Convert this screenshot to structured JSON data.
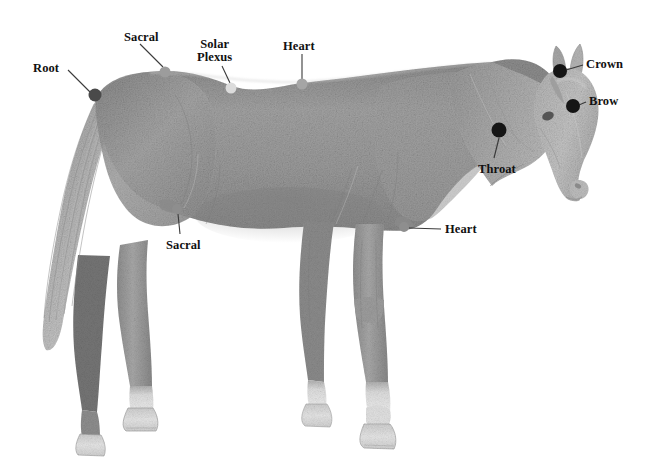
{
  "figure": {
    "style": "pencil drawing",
    "background_color": "#ffffff",
    "width": 655,
    "height": 471
  },
  "points": [
    {
      "id": "root",
      "label": "Root",
      "label_lines": [
        "Root"
      ],
      "label_x": 33,
      "label_y": 62,
      "dot_x": 95,
      "dot_y": 95,
      "dot_r": 6.5,
      "dot_color": "#4a4a4a",
      "leader_x1": 68,
      "leader_y1": 70,
      "leader_x2": 90,
      "leader_y2": 92
    },
    {
      "id": "sacral-upper",
      "label": "Sacral",
      "label_lines": [
        "Sacral"
      ],
      "label_x": 124,
      "label_y": 31,
      "dot_x": 165,
      "dot_y": 72,
      "dot_r": 5.5,
      "dot_color": "#9c9c9c",
      "leader_x1": 140,
      "leader_y1": 44,
      "leader_x2": 163,
      "leader_y2": 67
    },
    {
      "id": "solar-plexus",
      "label": "Solar Plexus",
      "label_lines": [
        "Solar",
        "Plexus"
      ],
      "label_x": 197,
      "label_y": 38,
      "dot_x": 231,
      "dot_y": 88,
      "dot_r": 5.5,
      "dot_color": "#dcdcdc",
      "leader_x1": 222,
      "leader_y1": 66,
      "leader_x2": 230,
      "leader_y2": 83
    },
    {
      "id": "heart-upper",
      "label": "Heart",
      "label_lines": [
        "Heart"
      ],
      "label_x": 283,
      "label_y": 40,
      "dot_x": 302,
      "dot_y": 84,
      "dot_r": 5.5,
      "dot_color": "#a5a5a5",
      "leader_x1": 302,
      "leader_y1": 54,
      "leader_x2": 302,
      "leader_y2": 79
    },
    {
      "id": "crown",
      "label": "Crown",
      "label_lines": [
        "Crown"
      ],
      "label_x": 586,
      "label_y": 58,
      "dot_x": 560,
      "dot_y": 71,
      "dot_r": 7,
      "dot_color": "#151515",
      "leader_x1": 583,
      "leader_y1": 65,
      "leader_x2": 566,
      "leader_y2": 70
    },
    {
      "id": "brow",
      "label": "Brow",
      "label_lines": [
        "Brow"
      ],
      "label_x": 589,
      "label_y": 95,
      "dot_x": 573,
      "dot_y": 106,
      "dot_r": 7,
      "dot_color": "#151515",
      "leader_x1": 586,
      "leader_y1": 102,
      "leader_x2": 579,
      "leader_y2": 105
    },
    {
      "id": "throat",
      "label": "Throat",
      "label_lines": [
        "Throat"
      ],
      "label_x": 478,
      "label_y": 163,
      "dot_x": 499,
      "dot_y": 130,
      "dot_r": 7.5,
      "dot_color": "#151515",
      "leader_x1": 494,
      "leader_y1": 158,
      "leader_x2": 499,
      "leader_y2": 138
    },
    {
      "id": "sacral-lower",
      "label": "Sacral",
      "label_lines": [
        "Sacral"
      ],
      "label_x": 166,
      "label_y": 239,
      "dot_x": 177,
      "dot_y": 209,
      "dot_r": 5,
      "dot_color": "#8e8e8e",
      "leader_x1": 180,
      "leader_y1": 234,
      "leader_x2": 178,
      "leader_y2": 214
    },
    {
      "id": "heart-lower",
      "label": "Heart",
      "label_lines": [
        "Heart"
      ],
      "label_x": 445,
      "label_y": 223,
      "dot_x": 404,
      "dot_y": 227,
      "dot_r": 5,
      "dot_color": "#8e8e8e",
      "leader_x1": 441,
      "leader_y1": 229,
      "leader_x2": 409,
      "leader_y2": 228
    }
  ],
  "colors": {
    "leader_line": "#3a3a3a",
    "label_text": "#111111",
    "body_mid": "#9a9a9a",
    "body_dark": "#6f6f6f",
    "body_light": "#c9c9c9",
    "hoof": "#e3e3e3"
  }
}
